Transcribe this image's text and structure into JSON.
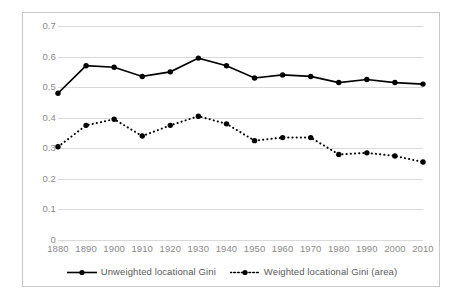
{
  "chart_data": {
    "type": "line",
    "title": "",
    "xlabel": "",
    "ylabel": "",
    "categories": [
      1880,
      1890,
      1900,
      1910,
      1920,
      1930,
      1940,
      1950,
      1960,
      1970,
      1980,
      1990,
      2000,
      2010
    ],
    "x_tick_labels": [
      "1880",
      "1890",
      "1900",
      "1910",
      "1920",
      "1930",
      "1940",
      "1950",
      "1960",
      "1970",
      "1980",
      "1990",
      "2000",
      "2010"
    ],
    "y_tick_labels": [
      "0",
      "0.1",
      "0.2",
      "0.3",
      "0.4",
      "0.5",
      "0.6",
      "0.7"
    ],
    "y_tick_values": [
      0,
      0.1,
      0.2,
      0.3,
      0.4,
      0.5,
      0.6,
      0.7
    ],
    "xlim": [
      1880,
      2010
    ],
    "ylim": [
      0,
      0.7
    ],
    "grid": "horizontal",
    "legend_position": "bottom",
    "series": [
      {
        "name": "Unweighted locational Gini",
        "style": "solid",
        "marker": "filled-circle",
        "color": "#000000",
        "values": [
          0.48,
          0.57,
          0.565,
          0.535,
          0.55,
          0.595,
          0.57,
          0.53,
          0.54,
          0.535,
          0.515,
          0.525,
          0.515,
          0.51
        ]
      },
      {
        "name": "Weighted locational Gini (area)",
        "style": "dotted",
        "marker": "filled-circle",
        "color": "#000000",
        "values": [
          0.305,
          0.375,
          0.395,
          0.34,
          0.375,
          0.405,
          0.38,
          0.325,
          0.335,
          0.335,
          0.28,
          0.285,
          0.275,
          0.255
        ]
      }
    ]
  },
  "legend": {
    "items": [
      {
        "label": "Unweighted locational Gini"
      },
      {
        "label": "Weighted locational Gini (area)"
      }
    ]
  },
  "colors": {
    "series": "#000000",
    "gridline": "#d9d9d9",
    "axis_text": "#8a8a8a",
    "legend_text": "#5a5a5a",
    "border": "#c8c8c8",
    "background": "#ffffff"
  }
}
